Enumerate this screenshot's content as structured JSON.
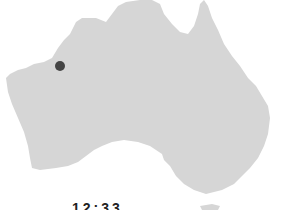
{
  "map": {
    "region": "Australia",
    "land_color": "#d6d6d6",
    "background_color": "#ffffff"
  },
  "marker": {
    "x": 60,
    "y": 66,
    "color": "#444444",
    "location": "Western Australia"
  },
  "label": {
    "text": "12:33"
  }
}
